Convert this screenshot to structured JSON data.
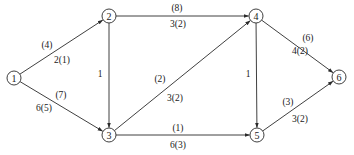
{
  "diagram": {
    "type": "directed network flow graph",
    "colors": {
      "stroke": "#2a2a2a",
      "text": "#1a1a1a",
      "background": "#ffffff"
    },
    "nodes": [
      {
        "id": "1",
        "label": "1",
        "x": 14,
        "y": 78
      },
      {
        "id": "2",
        "label": "2",
        "x": 109,
        "y": 16
      },
      {
        "id": "3",
        "label": "3",
        "x": 109,
        "y": 135
      },
      {
        "id": "4",
        "label": "4",
        "x": 256,
        "y": 16
      },
      {
        "id": "5",
        "label": "5",
        "x": 257,
        "y": 135
      },
      {
        "id": "6",
        "label": "6",
        "x": 339,
        "y": 77
      }
    ],
    "edges": [
      {
        "from": "1",
        "to": "2",
        "capacity": "(4)",
        "flow": "2(1)",
        "cap_pos": [
          47,
          48
        ],
        "flow_pos": [
          62,
          63
        ]
      },
      {
        "from": "1",
        "to": "3",
        "capacity": "(7)",
        "flow": "6(5)",
        "cap_pos": [
          61,
          98
        ],
        "flow_pos": [
          44,
          111
        ]
      },
      {
        "from": "2",
        "to": "3",
        "weight": "1",
        "w_pos": [
          100,
          77
        ]
      },
      {
        "from": "2",
        "to": "4",
        "capacity": "(8)",
        "flow": "3(2)",
        "cap_pos": [
          177,
          11
        ],
        "flow_pos": [
          178,
          27
        ]
      },
      {
        "from": "3",
        "to": "4",
        "capacity": "(2)",
        "flow": "3(2)",
        "cap_pos": [
          160,
          82
        ],
        "flow_pos": [
          175,
          101
        ]
      },
      {
        "from": "3",
        "to": "5",
        "capacity": "(1)",
        "flow": "6(3)",
        "cap_pos": [
          178,
          131
        ],
        "flow_pos": [
          178,
          148
        ]
      },
      {
        "from": "4",
        "to": "5",
        "weight": "1",
        "w_pos": [
          248,
          77
        ]
      },
      {
        "from": "4",
        "to": "6",
        "capacity": "(6)",
        "flow": "4(2)",
        "cap_pos": [
          308,
          41
        ],
        "flow_pos": [
          300,
          54
        ]
      },
      {
        "from": "5",
        "to": "6",
        "capacity": "(3)",
        "flow": "3(2)",
        "cap_pos": [
          288,
          105
        ],
        "flow_pos": [
          300,
          122
        ]
      }
    ]
  }
}
